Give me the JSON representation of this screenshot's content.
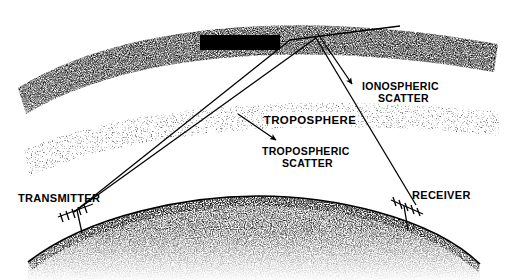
{
  "figure": {
    "style": "black-and-white stippled line art diagram",
    "background_color": "#ffffff",
    "ink_color": "#000000"
  },
  "layers": {
    "ionosphere": {
      "label": "IONOSPHERE",
      "label_style": "white text on black box",
      "label_text_color": "#ffffff",
      "label_box_color": "#000000",
      "band_shade": "dense dark stipple",
      "band_color": "#3a3a3a"
    },
    "troposphere": {
      "label": "TROPOSPHERE",
      "label_style": "black text knocked out of stipple",
      "label_text_color": "#000000",
      "label_box_color": "#ffffff",
      "band_shade": "light stipple",
      "band_color": "#9a9a9a"
    },
    "earth": {
      "label": "",
      "band_shade": "dense stipple fading downward",
      "band_color": "#2b2b2b"
    }
  },
  "annotations": [
    {
      "id": "ionospheric-scatter",
      "line1": "IONOSPHERIC",
      "line2": "SCATTER",
      "arrow_direction": "up-left"
    },
    {
      "id": "tropospheric-scatter",
      "line1": "TROPOSPHERIC",
      "line2": "SCATTER",
      "arrow_direction": "up-left"
    }
  ],
  "stations": {
    "transmitter": {
      "label": "TRANSMITTER",
      "antenna_type": "yagi-antenna"
    },
    "receiver": {
      "label": "RECEIVER",
      "antenna_type": "yagi-antenna"
    }
  },
  "ray_paths": {
    "count": 4,
    "description": "two rays up from transmitter, two rays down to receiver, crossing in an X"
  }
}
